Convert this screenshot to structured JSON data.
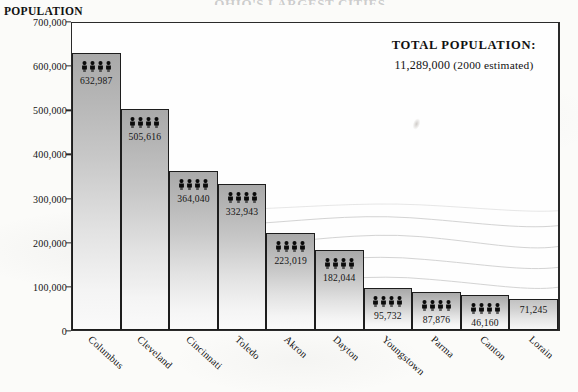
{
  "chart_title": "OHIO'S LARGEST CITIES",
  "axis_title": "POPULATION",
  "total": {
    "label": "TOTAL POPULATION:",
    "value": "11,289,000",
    "note": "(2000 estimated)"
  },
  "chart_data": {
    "type": "bar",
    "title": "OHIO'S LARGEST CITIES",
    "xlabel": "",
    "ylabel": "POPULATION",
    "ylim": [
      0,
      700000
    ],
    "yticks": [
      "0",
      "100,000",
      "200,000",
      "300,000",
      "400,000",
      "500,000",
      "600,000",
      "700,000"
    ],
    "ytick_values": [
      0,
      100000,
      200000,
      300000,
      400000,
      500000,
      600000,
      700000
    ],
    "grid": false,
    "legend": "none",
    "categories": [
      "Columbus",
      "Cleveland",
      "Cincinnati",
      "Toledo",
      "Akron",
      "Dayton",
      "Youngstown",
      "Parma",
      "Canton",
      "Lorain"
    ],
    "values": [
      632987,
      505616,
      364040,
      332943,
      223019,
      182044,
      95732,
      87876,
      80806,
      71245
    ],
    "value_labels": [
      "632,987",
      "505,616",
      "364,040",
      "332,943",
      "223,019",
      "182,044",
      "95,732",
      "87,876",
      "46,160",
      "71,245"
    ],
    "bar_icon": "people-icon",
    "bars_with_icon": [
      true,
      true,
      true,
      true,
      true,
      true,
      true,
      true,
      true,
      false
    ],
    "annotations": [
      "TOTAL POPULATION: 11,289,000 (2000 estimated)"
    ]
  },
  "icons": {
    "people": "people-icon"
  },
  "colors": {
    "bar_top": "#a9a9a9",
    "bar_bottom": "#fafafa",
    "frame": "#2a2a2a",
    "text": "#111111",
    "background": "#fbfbf9"
  }
}
